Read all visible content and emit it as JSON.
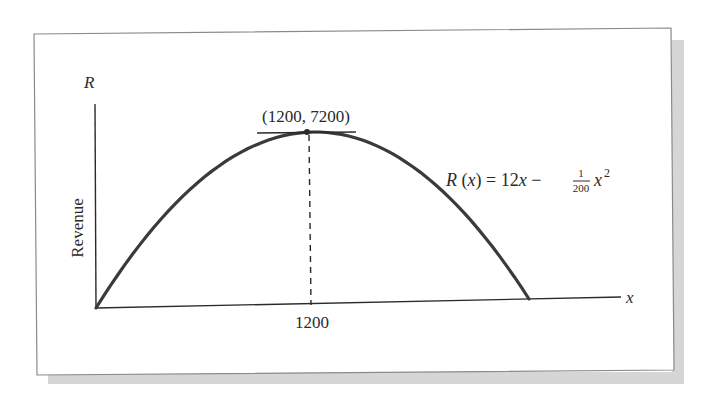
{
  "chart_data": {
    "type": "line",
    "title": "",
    "function": "R(x) = 12x - (1/200) x^2",
    "equation_label": {
      "lhs": "R (x) = 12x −",
      "frac_num": "1",
      "frac_den": "200",
      "rhs_var": "x",
      "rhs_exp": "2"
    },
    "xlabel": "x",
    "ylabel_symbol": "R",
    "ylabel": "Revenue",
    "x_ticks": [
      "1200"
    ],
    "xlim": [
      0,
      2400
    ],
    "ylim": [
      0,
      7200
    ],
    "series": [
      {
        "name": "R(x)",
        "x": [
          0,
          200,
          400,
          600,
          800,
          1000,
          1200,
          1400,
          1600,
          1800,
          2000,
          2200,
          2400
        ],
        "values": [
          0,
          2200,
          4000,
          5400,
          6400,
          7000,
          7200,
          7000,
          6400,
          5400,
          4000,
          2200,
          0
        ]
      }
    ],
    "annotations": [
      {
        "type": "point",
        "label": "(1200, 7200)",
        "x": 1200,
        "y": 7200
      },
      {
        "type": "tangent",
        "description": "horizontal tangent line at maximum",
        "y": 7200
      },
      {
        "type": "dashed-vertical",
        "x": 1200
      }
    ],
    "grid": false,
    "legend": "none"
  },
  "colors": {
    "curve": "#3a3a3a",
    "axes": "#2a2a2a",
    "frame_border": "#8a8a8a",
    "shadow": "#d4d4d4"
  }
}
